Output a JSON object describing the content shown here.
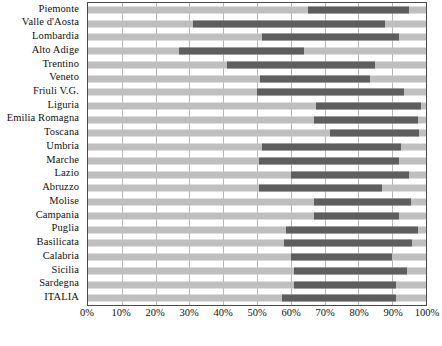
{
  "chart_data": {
    "type": "bar",
    "subtype": "floating-range-bar",
    "title": "",
    "xlabel": "",
    "ylabel": "",
    "xlim": [
      0,
      100
    ],
    "xtick_labels": [
      "0%",
      "10%",
      "20%",
      "30%",
      "40%",
      "50%",
      "60%",
      "70%",
      "80%",
      "90%",
      "100%"
    ],
    "xtick_values": [
      0,
      10,
      20,
      30,
      40,
      50,
      60,
      70,
      80,
      90,
      100
    ],
    "grid": true,
    "legend": "none",
    "categories": [
      "Piemonte",
      "Valle d'Aosta",
      "Lombardia",
      "Alto Adige",
      "Trentino",
      "Veneto",
      "Friuli V.G.",
      "Liguria",
      "Emilia Romagna",
      "Toscana",
      "Umbria",
      "Marche",
      "Lazio",
      "Abruzzo",
      "Molise",
      "Campania",
      "Puglia",
      "Basilicata",
      "Calabria",
      "Sicilia",
      "Sardegna",
      "ITALIA"
    ],
    "series": [
      {
        "name": "range-start",
        "values": [
          65,
          31,
          51.5,
          27,
          41,
          51,
          50,
          67.5,
          67,
          71.5,
          51.5,
          50.5,
          60,
          50.5,
          67,
          67,
          58.5,
          58,
          60,
          61,
          61,
          57.5
        ]
      },
      {
        "name": "range-end",
        "values": [
          95,
          88,
          92,
          64,
          85,
          83.5,
          93.5,
          98.5,
          97.5,
          98,
          92.5,
          92,
          95,
          87,
          95.5,
          92,
          97.5,
          96,
          90,
          94.5,
          91,
          91
        ]
      }
    ],
    "bars": [
      {
        "category": "Piemonte",
        "start": 65,
        "end": 95
      },
      {
        "category": "Valle d'Aosta",
        "start": 31,
        "end": 88
      },
      {
        "category": "Lombardia",
        "start": 51.5,
        "end": 92
      },
      {
        "category": "Alto Adige",
        "start": 27,
        "end": 64
      },
      {
        "category": "Trentino",
        "start": 41,
        "end": 85
      },
      {
        "category": "Veneto",
        "start": 51,
        "end": 83.5
      },
      {
        "category": "Friuli V.G.",
        "start": 50,
        "end": 93.5
      },
      {
        "category": "Liguria",
        "start": 67.5,
        "end": 98.5
      },
      {
        "category": "Emilia Romagna",
        "start": 67,
        "end": 97.5
      },
      {
        "category": "Toscana",
        "start": 71.5,
        "end": 98
      },
      {
        "category": "Umbria",
        "start": 51.5,
        "end": 92.5
      },
      {
        "category": "Marche",
        "start": 50.5,
        "end": 92
      },
      {
        "category": "Lazio",
        "start": 60,
        "end": 95
      },
      {
        "category": "Abruzzo",
        "start": 50.5,
        "end": 87
      },
      {
        "category": "Molise",
        "start": 67,
        "end": 95.5
      },
      {
        "category": "Campania",
        "start": 67,
        "end": 92
      },
      {
        "category": "Puglia",
        "start": 58.5,
        "end": 97.5
      },
      {
        "category": "Basilicata",
        "start": 58,
        "end": 96
      },
      {
        "category": "Calabria",
        "start": 60,
        "end": 90
      },
      {
        "category": "Sicilia",
        "start": 61,
        "end": 94.5
      },
      {
        "category": "Sardegna",
        "start": 61,
        "end": 91
      },
      {
        "category": "ITALIA",
        "start": 57.5,
        "end": 91
      }
    ],
    "colors": {
      "track": "#bfbfbf",
      "bar": "#5e5e5e",
      "grid": "#b9b9b9",
      "frame": "#4a4a4a",
      "text": "#111111"
    }
  },
  "footer": {
    "caption": ""
  }
}
